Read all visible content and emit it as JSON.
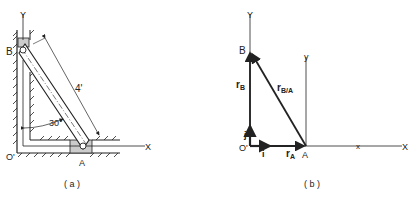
{
  "panel_a": {
    "caption": "( a )",
    "axis_y_label": "Y",
    "axis_x_label": "X",
    "origin_label": "O'",
    "point_b_label": "B",
    "point_a_label": "A",
    "length_label": "4'",
    "angle_label": "30°"
  },
  "panel_b": {
    "caption": "( b )",
    "axis_Y_label": "Y",
    "axis_X_label": "X",
    "local_y_label": "y",
    "local_x_label": "x",
    "origin_label": "O'",
    "point_b_label": "B",
    "point_a_label": "A",
    "r_b_label": "r",
    "r_b_sub": "B",
    "r_ba_label": "r",
    "r_ba_sub": "B/A",
    "r_a_label": "r",
    "r_a_sub": "A",
    "unit_i_label": "i",
    "unit_j_label": "j"
  },
  "colors": {
    "ink": "#222222",
    "hatch_fill": "#cccccc"
  }
}
